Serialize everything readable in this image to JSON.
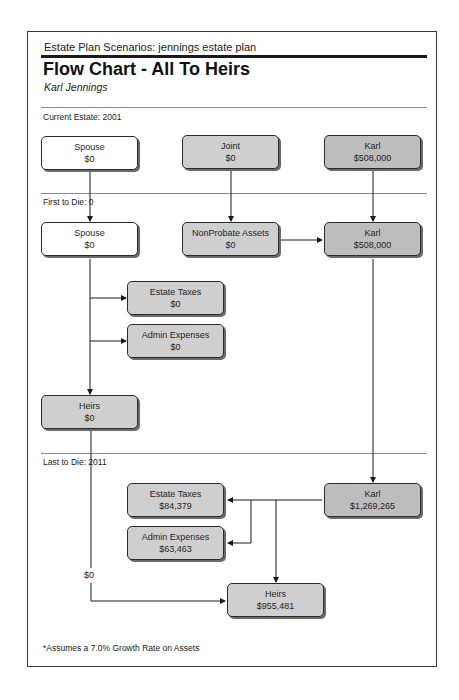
{
  "header": {
    "scenario_line": "Estate Plan Scenarios:  jennings estate plan",
    "title": "Flow Chart - All To Heirs",
    "subtitle": "Karl Jennings"
  },
  "sections": {
    "current": {
      "label": "Current Estate: 2001"
    },
    "first_to_die": {
      "label": "First to Die: 0"
    },
    "last_to_die": {
      "label": "Last to Die: 2011"
    }
  },
  "current_estate": {
    "spouse": {
      "name": "Spouse",
      "value": "$0"
    },
    "joint": {
      "name": "Joint",
      "value": "$0"
    },
    "karl": {
      "name": "Karl",
      "value": "$508,000"
    }
  },
  "first_to_die": {
    "spouse": {
      "name": "Spouse",
      "value": "$0"
    },
    "nonprobate": {
      "name": "NonProbate Assets",
      "value": "$0"
    },
    "karl": {
      "name": "Karl",
      "value": "$508,000"
    },
    "estate_taxes": {
      "name": "Estate Taxes",
      "value": "$0"
    },
    "admin_expenses": {
      "name": "Admin Expenses",
      "value": "$0"
    },
    "heirs": {
      "name": "Heirs",
      "value": "$0"
    }
  },
  "last_to_die": {
    "karl": {
      "name": "Karl",
      "value": "$1,269,265"
    },
    "estate_taxes": {
      "name": "Estate Taxes",
      "value": "$84,379"
    },
    "admin_expenses": {
      "name": "Admin Expenses",
      "value": "$63,463"
    },
    "heirs": {
      "name": "Heirs",
      "value": "$955,481"
    },
    "transfer_label": "$0"
  },
  "footnote": "*Assumes a 7.0% Growth Rate on Assets",
  "colors": {
    "border": "#3a3a3a",
    "box_fill_light": "#cfcfcf",
    "box_fill_dark": "#bdbdbd",
    "rule": "#8a8a8a"
  }
}
